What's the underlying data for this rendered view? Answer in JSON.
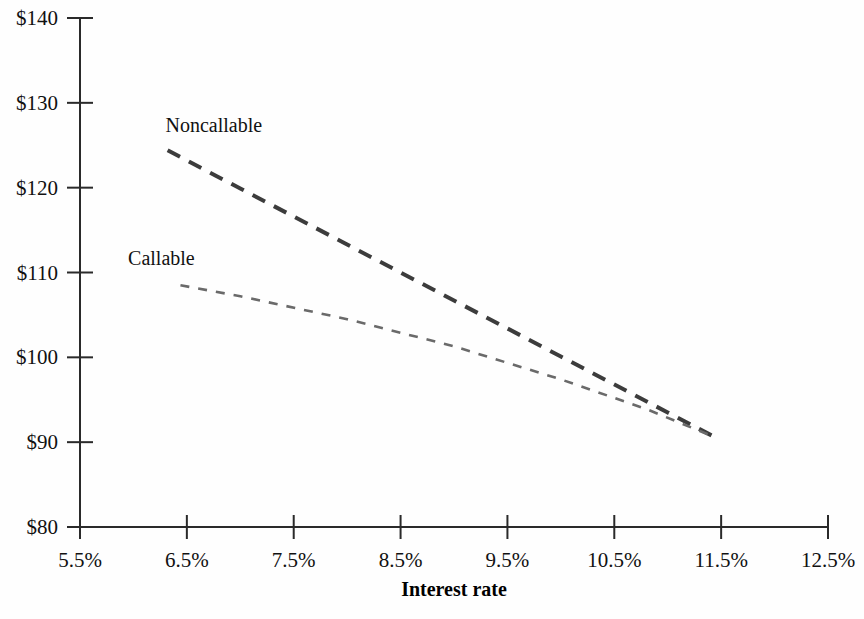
{
  "chart_data": {
    "type": "line",
    "title": "",
    "subtitle": "",
    "xlabel": "Interest rate",
    "ylabel": "",
    "xlim": [
      5.5,
      12.5
    ],
    "ylim": [
      80,
      140
    ],
    "grid": false,
    "legend_position": "inline-annotations",
    "x_tick_labels": [
      "5.5%",
      "6.5%",
      "7.5%",
      "8.5%",
      "9.5%",
      "10.5%",
      "11.5%",
      "12.5%"
    ],
    "x_tick_values": [
      5.5,
      6.5,
      7.5,
      8.5,
      9.5,
      10.5,
      11.5,
      12.5
    ],
    "y_tick_labels": [
      "$80",
      "$90",
      "$100",
      "$110",
      "$120",
      "$130",
      "$140"
    ],
    "y_tick_values": [
      80,
      90,
      100,
      110,
      120,
      130,
      140
    ],
    "series": [
      {
        "name": "Noncallable",
        "label_x": 6.3,
        "label_y": 126.6,
        "dash": "14,10",
        "width": 4,
        "color": "#3c3c3c",
        "x": [
          6.32,
          7.0,
          8.0,
          9.0,
          10.0,
          11.0,
          11.44
        ],
        "values": [
          124.4,
          119.9,
          113.3,
          106.7,
          100.1,
          93.5,
          90.6
        ]
      },
      {
        "name": "Callable",
        "label_x": 5.95,
        "label_y": 110.9,
        "dash": "9,9",
        "width": 2.6,
        "color": "#6a6a6a",
        "x": [
          6.44,
          7.0,
          8.0,
          9.0,
          10.0,
          10.8,
          11.44
        ],
        "values": [
          108.5,
          107.2,
          104.5,
          101.3,
          97.4,
          93.9,
          90.6
        ]
      }
    ],
    "annotations": [
      {
        "text": "Noncallable",
        "x": 6.3,
        "y": 126.6
      },
      {
        "text": "Callable",
        "x": 5.95,
        "y": 110.9
      }
    ]
  },
  "axis": {
    "x_title": "Interest rate",
    "y_ticks": [
      {
        "label": "$140",
        "value": 140
      },
      {
        "label": "$130",
        "value": 130
      },
      {
        "label": "$120",
        "value": 120
      },
      {
        "label": "$110",
        "value": 110
      },
      {
        "label": "$100",
        "value": 100
      },
      {
        "label": "$90",
        "value": 90
      },
      {
        "label": "$80",
        "value": 80
      }
    ],
    "x_ticks": [
      {
        "label": "5.5%",
        "value": 5.5
      },
      {
        "label": "6.5%",
        "value": 6.5
      },
      {
        "label": "7.5%",
        "value": 7.5
      },
      {
        "label": "8.5%",
        "value": 8.5
      },
      {
        "label": "9.5%",
        "value": 9.5
      },
      {
        "label": "10.5%",
        "value": 10.5
      },
      {
        "label": "11.5%",
        "value": 11.5
      },
      {
        "label": "12.5%",
        "value": 12.5
      }
    ]
  },
  "colors": {
    "axis": "#2a2a2a",
    "noncallable": "#3c3c3c",
    "callable": "#6a6a6a",
    "background": "#fefefe",
    "text": "#111111"
  }
}
